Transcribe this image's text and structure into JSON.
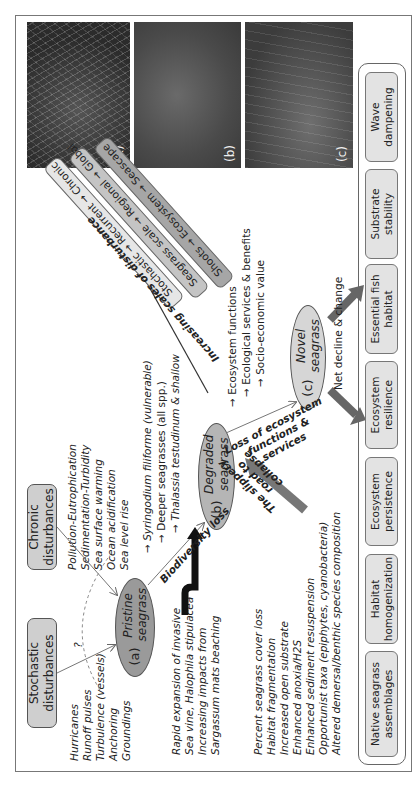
{
  "figure": {
    "photos": [
      {
        "label": "(a)",
        "description": "Pristine seagrass meadow photo"
      },
      {
        "label": "(b)",
        "description": "Degraded seagrass photo"
      },
      {
        "label": "(c)",
        "description": "Novel seagrass photo"
      }
    ],
    "disturbances": {
      "stochastic": {
        "label": "Stochastic disturbances",
        "items": [
          "Hurricanes",
          "Runoff pulses",
          "Turbulence (vessels)",
          "Anchoring",
          "Groundings"
        ]
      },
      "chronic": {
        "label": "Chronic disturbances",
        "items": [
          "Pollution-Eutrophication",
          "Sedimentation-Turbidity",
          "Sea surface warming",
          "Ocean acidification",
          "Sea level rise"
        ]
      },
      "question_mark": "?"
    },
    "states": {
      "pristine": {
        "tag": "(a)",
        "label": "Pristine seagrass"
      },
      "degraded": {
        "tag": "(b)",
        "label": "Degraded seagrass"
      },
      "novel": {
        "tag": "(c)",
        "label": "Novel seagrass"
      }
    },
    "transitions": {
      "biodiversity_loss": "Biodiversity loss",
      "loss_of_functions": "Loss of ecosystem functions & services",
      "slippery_road": "The slippery road to collapse",
      "net_decline": "Net decline & change"
    },
    "biodiversity_items": [
      "Syringodium filiforme (vulnerable)",
      "Deeper seagrasses (all spp.)",
      "Thalassia testudinum & shallow"
    ],
    "function_items": [
      "Ecosystem functions",
      "Ecological services & benefits",
      "Socio-economic value"
    ],
    "invasive_items": [
      "Rapid expansion of invasive",
      "Sea vine, Halophila stipulacea",
      "Increasing impacts from",
      "Sargassum mats beaching"
    ],
    "degradation_items": [
      "Percent seagrass cover loss",
      "Habitat fragmentation",
      "Increased open substrate",
      "Enhanced anoxia/H2S",
      "Enhanced sediment resuspension",
      "Opportunist taxa (epiphytes, cyanobacteria)",
      "Altered demersal/benthic species composition"
    ],
    "scales": {
      "title": "Increasing scales of disturbance",
      "bands": [
        {
          "label": "Stochastic → Recurrent → Chronic",
          "color": "#e6e6e6"
        },
        {
          "label": "Seagrass scale → Regional → Global",
          "color": "#c4c4c4"
        },
        {
          "label": "Shoots → Ecosystem → Seascape",
          "color": "#a6a6a6"
        }
      ]
    },
    "outcomes": [
      "Native seagrass assemblages",
      "Habitat homogenization",
      "Ecosystem persistence",
      "Ecosystem resilience",
      "Essential fish habitat",
      "Substrate stability",
      "Wave dampening"
    ]
  }
}
